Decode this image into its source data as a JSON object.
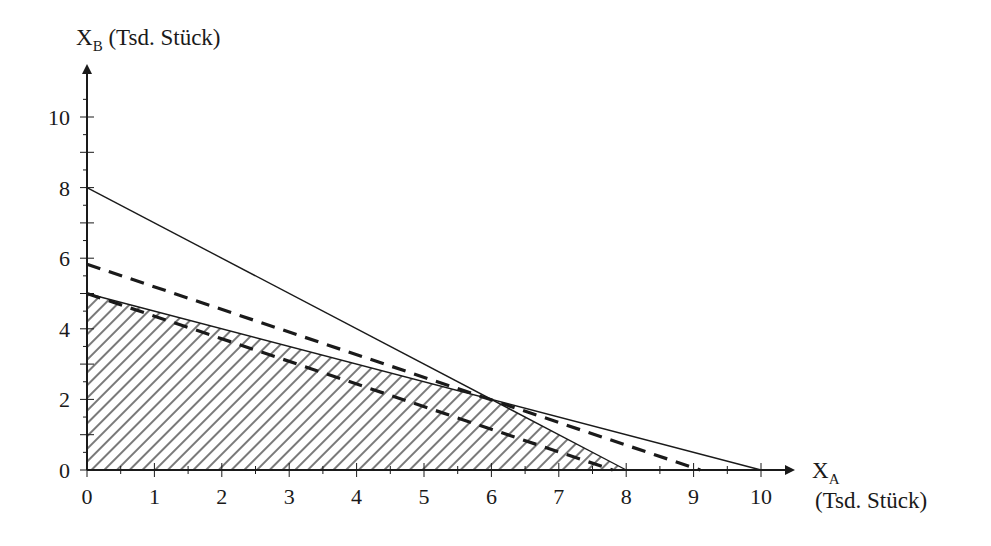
{
  "chart_data": {
    "type": "line",
    "title": "",
    "xlabel": "X_A (Tsd. Stück)",
    "ylabel": "X_B (Tsd. Stück)",
    "xlabel_main": "X",
    "xlabel_sub": "A",
    "xlabel_unit": "(Tsd. Stück)",
    "ylabel_main": "X",
    "ylabel_sub": "B",
    "ylabel_unit": "(Tsd. Stück)",
    "xlim": [
      0,
      10
    ],
    "ylim": [
      0,
      10
    ],
    "x_ticks": [
      "0",
      "1",
      "2",
      "3",
      "4",
      "5",
      "6",
      "7",
      "8",
      "9",
      "10"
    ],
    "y_ticks": [
      "0",
      "2",
      "4",
      "6",
      "8",
      "10"
    ],
    "grid": false,
    "legend": "none",
    "series": [
      {
        "name": "constraint-1",
        "style": "solid",
        "points": [
          [
            0,
            8
          ],
          [
            8,
            0
          ]
        ]
      },
      {
        "name": "constraint-2",
        "style": "solid",
        "points": [
          [
            0,
            5
          ],
          [
            10,
            0
          ]
        ]
      },
      {
        "name": "isoprofit-line-1",
        "style": "dashed",
        "points": [
          [
            0,
            5
          ],
          [
            7.8,
            0
          ]
        ]
      },
      {
        "name": "isoprofit-line-2",
        "style": "dashed",
        "points": [
          [
            0,
            5.83
          ],
          [
            9.1,
            0
          ]
        ]
      }
    ],
    "feasible_region": {
      "fill": "hatched",
      "vertices": [
        [
          0,
          0
        ],
        [
          0,
          5
        ],
        [
          6,
          2
        ],
        [
          8,
          0
        ]
      ]
    },
    "optimum": [
      6,
      2
    ]
  }
}
